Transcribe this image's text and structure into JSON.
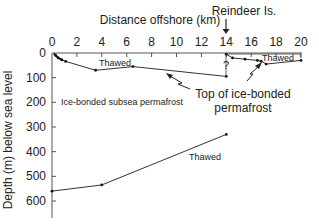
{
  "chart_data": {
    "type": "line",
    "title": "",
    "xlabel": "Distance offshore (km)",
    "ylabel": "Depth (m) below sea level",
    "xlim": [
      0,
      20
    ],
    "ylim": [
      0,
      600
    ],
    "y_inverted": true,
    "x_axis_position": "top",
    "x_ticks": [
      0,
      2,
      4,
      6,
      8,
      10,
      12,
      14,
      16,
      18,
      20
    ],
    "y_ticks": [
      0,
      100,
      200,
      300,
      400,
      500,
      600
    ],
    "grid": false,
    "series": [
      {
        "name": "Top of ice-bonded permafrost (mainland shelf)",
        "x": [
          0.3,
          0.5,
          0.8,
          1.1,
          3.5,
          6.5,
          14
        ],
        "y": [
          10,
          20,
          28,
          34,
          70,
          55,
          95
        ]
      },
      {
        "name": "Top of ice-bonded permafrost (Reindeer Is. area)",
        "x": [
          14,
          14.5,
          15.5,
          16.5,
          16.8,
          17.2,
          20
        ],
        "y": [
          5,
          20,
          25,
          30,
          33,
          45,
          30
        ]
      },
      {
        "name": "Base of ice-bonded permafrost",
        "x": [
          0,
          4,
          14
        ],
        "y": [
          560,
          535,
          330
        ]
      }
    ],
    "annotations": [
      {
        "text": "Reindeer Is.",
        "x": 14,
        "y": -60,
        "arrow_to": [
          14,
          0
        ]
      },
      {
        "text": "Thawed",
        "x": 5,
        "y": 35
      },
      {
        "text": "Thawed",
        "x": 18.2,
        "y": 15
      },
      {
        "text": "Ice-bonded subsea permafrost",
        "x": 5.5,
        "y": 200
      },
      {
        "text": "Thawed",
        "x": 12,
        "y": 455
      },
      {
        "text": "Top of ice-bonded permafrost",
        "x": 14.5,
        "y": 140
      },
      {
        "text": "?",
        "x": 14,
        "y": 70
      }
    ]
  },
  "labels": {
    "x_axis_title": "Distance offshore (km)",
    "y_axis_title": "Depth (m) below sea level",
    "island": "Reindeer Is.",
    "thawed_upper": "Thawed",
    "thawed_island": "Thawed",
    "thawed_lower": "Thawed",
    "permafrost_zone": "Ice-bonded subsea permafrost",
    "top_label_line1": "Top of ice-bonded",
    "top_label_line2": "permafrost",
    "question": "?",
    "xticks": [
      "0",
      "2",
      "4",
      "6",
      "8",
      "10",
      "12",
      "14",
      "16",
      "18",
      "20"
    ],
    "yticks": [
      "0",
      "100",
      "200",
      "300",
      "400",
      "500",
      "600"
    ]
  }
}
